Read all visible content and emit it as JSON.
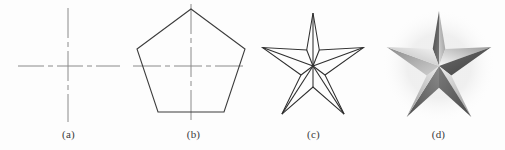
{
  "figure": {
    "background_color": "#fdfdfd",
    "width": 505,
    "height": 150
  },
  "panels": [
    {
      "id": "a",
      "caption": "(a)",
      "content_name": "centerlines",
      "stroke_color": "#8a8a8a",
      "stroke_width": 1,
      "line_style": "dash-dot",
      "center": {
        "x": 62,
        "y": 66
      },
      "horizontal_line": {
        "x1": 12,
        "y1": 66,
        "x2": 114,
        "y2": 66
      },
      "vertical_line": {
        "x1": 62,
        "y1": 8,
        "x2": 62,
        "y2": 122
      }
    },
    {
      "id": "b",
      "caption": "(b)",
      "content_name": "pentagon-with-centerlines",
      "stroke_color": "#3c3c3c",
      "stroke_width": 1.1,
      "centerline_color": "#8a8a8a",
      "centerline_style": "dash-dot",
      "center": {
        "x": 60,
        "y": 66
      },
      "circumradius": 57,
      "sides": 5,
      "vertices": [
        {
          "x": 60,
          "y": 9
        },
        {
          "x": 114,
          "y": 49
        },
        {
          "x": 93,
          "y": 112
        },
        {
          "x": 27,
          "y": 112
        },
        {
          "x": 6,
          "y": 49
        }
      ],
      "horizontal_line": {
        "x1": 2,
        "y1": 66,
        "x2": 118,
        "y2": 66
      },
      "vertical_line": {
        "x1": 60,
        "y1": 4,
        "x2": 60,
        "y2": 124
      }
    },
    {
      "id": "c",
      "caption": "(c)",
      "content_name": "wireframe-star",
      "stroke_color": "#2e2e2e",
      "stroke_width": 1.1,
      "center": {
        "x": 62,
        "y": 66
      },
      "points": 5,
      "outer_radius": 53,
      "inner_radius": 21,
      "has_radial_lines": true,
      "radial_line_count": 10,
      "fill": "none"
    },
    {
      "id": "d",
      "caption": "(d)",
      "content_name": "shaded-3d-star",
      "center": {
        "x": 63,
        "y": 66
      },
      "points": 5,
      "outer_radius": 55,
      "inner_radius": 22,
      "shading": "faceted-metallic",
      "facet_count": 10,
      "highlight_color": "#f2f2f2",
      "midtone_color": "#b9b9b9",
      "shadow_color": "#4d4d4d",
      "deep_shadow_color": "#3a3a3a",
      "halo_color": "#e9e9e9"
    }
  ]
}
